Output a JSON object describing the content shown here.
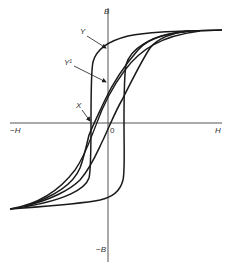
{
  "diagram": {
    "type": "hysteresis-loop",
    "labels": {
      "b_pos": "B",
      "b_neg": "−B",
      "h_pos": "H",
      "h_neg": "−H",
      "origin": "0",
      "y": "Y",
      "y1": "Y¹",
      "x": "X"
    },
    "colors": {
      "curve": "#1a1a1a",
      "axis": "#555555",
      "background": "#ffffff"
    }
  }
}
